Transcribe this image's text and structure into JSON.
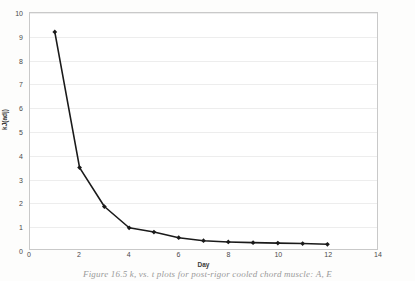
{
  "figure": {
    "caption": "Figure 16.5  k, vs. t plots for post-rigor cooled chord muscle: A, E"
  },
  "chart_data": {
    "type": "line",
    "title": "",
    "xlabel": "Day",
    "ylabel": "kJ(adj)",
    "xlim": [
      0,
      14
    ],
    "ylim": [
      0,
      10
    ],
    "xticks": [
      0,
      2,
      4,
      6,
      8,
      10,
      12,
      14
    ],
    "yticks": [
      0,
      1,
      2,
      3,
      4,
      5,
      6,
      7,
      8,
      9,
      10
    ],
    "grid": true,
    "legend": "none",
    "marker": "diamond",
    "line_color": "#1a1a1a",
    "x": [
      1,
      2,
      3,
      4,
      5,
      6,
      7,
      8,
      9,
      10,
      11,
      12
    ],
    "values": [
      9.2,
      3.45,
      1.8,
      0.9,
      0.72,
      0.48,
      0.35,
      0.3,
      0.27,
      0.25,
      0.23,
      0.2
    ],
    "series": [
      {
        "name": "k",
        "values": [
          9.2,
          3.45,
          1.8,
          0.9,
          0.72,
          0.48,
          0.35,
          0.3,
          0.27,
          0.25,
          0.23,
          0.2
        ]
      }
    ]
  }
}
